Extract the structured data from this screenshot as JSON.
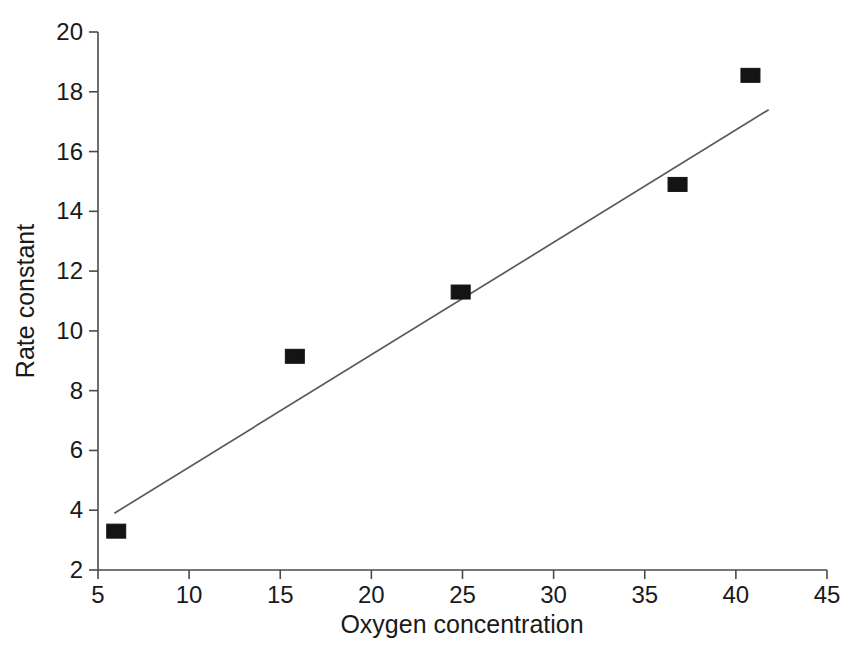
{
  "chart_data": {
    "type": "scatter",
    "title": "",
    "xlabel": "Oxygen concentration",
    "ylabel": "Rate constant",
    "xlim": [
      5,
      45
    ],
    "ylim": [
      2,
      20
    ],
    "xticks": [
      5,
      10,
      15,
      20,
      25,
      30,
      35,
      40,
      45
    ],
    "yticks": [
      2,
      4,
      6,
      8,
      10,
      12,
      14,
      16,
      18,
      20
    ],
    "xtick_labels": [
      "5",
      "10",
      "15",
      "20",
      "25",
      "30",
      "35",
      "40",
      "45"
    ],
    "ytick_labels": [
      "2",
      "4",
      "6",
      "8",
      "10",
      "12",
      "14",
      "16",
      "18",
      "20"
    ],
    "grid": false,
    "legend": "none",
    "marker_style": "filled-square",
    "marker_color": "#141414",
    "line_color": "#5a5a5a",
    "axis_color": "#4a4a4a",
    "series": [
      {
        "name": "Rate constant",
        "type": "scatter",
        "points": [
          {
            "x": 6.0,
            "y": 3.3
          },
          {
            "x": 15.8,
            "y": 9.15
          },
          {
            "x": 24.9,
            "y": 11.3
          },
          {
            "x": 36.8,
            "y": 14.9
          },
          {
            "x": 40.8,
            "y": 18.55
          }
        ]
      },
      {
        "name": "Fitted line",
        "type": "line",
        "points": [
          {
            "x": 5.9,
            "y": 3.9
          },
          {
            "x": 41.8,
            "y": 17.4
          }
        ]
      }
    ]
  },
  "axes": {
    "x_title": "Oxygen concentration",
    "y_title": "Rate constant"
  }
}
